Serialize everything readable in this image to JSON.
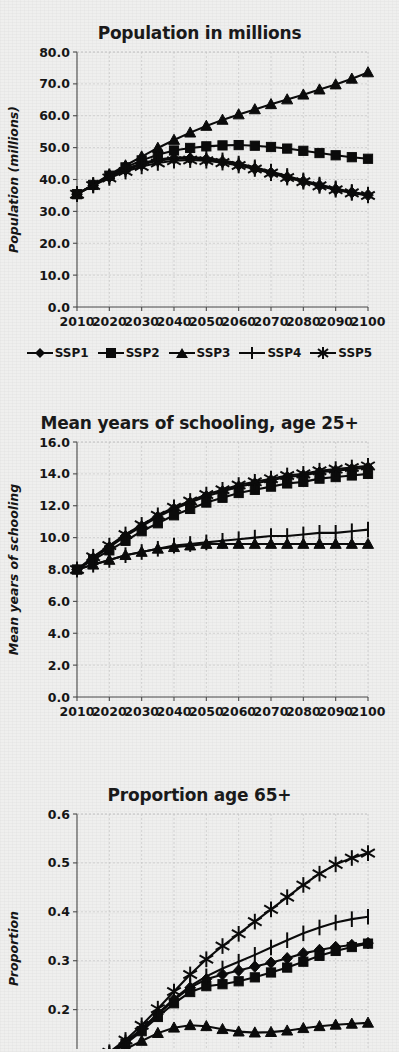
{
  "figure": {
    "background_color": "#efefee",
    "ink_color": "#0b0b0b",
    "grid_color": "#c9c9c9"
  },
  "legend": {
    "position": "below-first-chart",
    "items": [
      {
        "label": "SSP1",
        "marker": "diamond-marker"
      },
      {
        "label": "SSP2",
        "marker": "square-marker"
      },
      {
        "label": "SSP3",
        "marker": "triangle-marker"
      },
      {
        "label": "SSP4",
        "marker": "plus-marker"
      },
      {
        "label": "SSP5",
        "marker": "asterisk-marker"
      }
    ]
  },
  "chart_data": [
    {
      "type": "line",
      "title": "Population in millions",
      "xlabel": "",
      "ylabel": "Population (millions)",
      "xlim": [
        2010,
        2100
      ],
      "ylim": [
        0.0,
        80.0
      ],
      "yticks": [
        "0.0",
        "10.0",
        "20.0",
        "30.0",
        "40.0",
        "50.0",
        "60.0",
        "70.0",
        "80.0"
      ],
      "ytick_values": [
        0,
        10,
        20,
        30,
        40,
        50,
        60,
        70,
        80
      ],
      "xticks": [
        "2010",
        "2020",
        "2030",
        "2040",
        "2050",
        "2060",
        "2070",
        "2080",
        "2090",
        "2100"
      ],
      "xtick_values": [
        2010,
        2020,
        2030,
        2040,
        2050,
        2060,
        2070,
        2080,
        2090,
        2100
      ],
      "grid": true,
      "x": [
        2010,
        2015,
        2020,
        2025,
        2030,
        2035,
        2040,
        2045,
        2050,
        2055,
        2060,
        2065,
        2070,
        2075,
        2080,
        2085,
        2090,
        2095,
        2100
      ],
      "series": [
        {
          "name": "SSP1",
          "marker": "diamond-marker",
          "values": [
            35.4,
            38.2,
            40.8,
            43.0,
            44.7,
            45.9,
            46.5,
            46.6,
            46.3,
            45.6,
            44.6,
            43.4,
            42.1,
            40.7,
            39.4,
            38.1,
            36.9,
            35.9,
            35.1
          ]
        },
        {
          "name": "SSP2",
          "marker": "square-marker",
          "values": [
            35.4,
            38.3,
            41.2,
            43.8,
            46.0,
            47.8,
            49.1,
            49.9,
            50.4,
            50.7,
            50.8,
            50.6,
            50.2,
            49.7,
            49.0,
            48.3,
            47.6,
            47.0,
            46.5
          ]
        },
        {
          "name": "SSP3",
          "marker": "triangle-marker",
          "values": [
            35.4,
            38.4,
            41.5,
            44.4,
            47.2,
            49.9,
            52.4,
            54.7,
            56.8,
            58.7,
            60.4,
            62.0,
            63.6,
            65.1,
            66.6,
            68.2,
            69.8,
            71.6,
            73.6
          ]
        },
        {
          "name": "SSP4",
          "marker": "plus-marker",
          "values": [
            35.4,
            38.3,
            41.0,
            43.3,
            45.1,
            46.3,
            46.9,
            47.0,
            46.7,
            46.0,
            45.0,
            43.8,
            42.5,
            41.1,
            39.7,
            38.4,
            37.2,
            36.1,
            35.3
          ]
        },
        {
          "name": "SSP5",
          "marker": "asterisk-marker",
          "values": [
            35.4,
            38.1,
            40.5,
            42.5,
            44.1,
            45.2,
            45.9,
            46.1,
            45.9,
            45.3,
            44.4,
            43.3,
            42.0,
            40.6,
            39.3,
            38.0,
            36.8,
            35.8,
            35.0
          ]
        }
      ]
    },
    {
      "type": "line",
      "title": "Mean years of schooling, age 25+",
      "xlabel": "",
      "ylabel": "Mean years of schooling",
      "xlim": [
        2010,
        2100
      ],
      "ylim": [
        0.0,
        16.0
      ],
      "yticks": [
        "0.0",
        "2.0",
        "4.0",
        "6.0",
        "8.0",
        "10.0",
        "12.0",
        "14.0",
        "16.0"
      ],
      "ytick_values": [
        0,
        2,
        4,
        6,
        8,
        10,
        12,
        14,
        16
      ],
      "xticks": [
        "2010",
        "2020",
        "2030",
        "2040",
        "2050",
        "2060",
        "2070",
        "2080",
        "2090",
        "2100"
      ],
      "xtick_values": [
        2010,
        2020,
        2030,
        2040,
        2050,
        2060,
        2070,
        2080,
        2090,
        2100
      ],
      "grid": true,
      "x": [
        2010,
        2015,
        2020,
        2025,
        2030,
        2035,
        2040,
        2045,
        2050,
        2055,
        2060,
        2065,
        2070,
        2075,
        2080,
        2085,
        2090,
        2095,
        2100
      ],
      "series": [
        {
          "name": "SSP1",
          "marker": "diamond-marker",
          "values": [
            8.0,
            8.7,
            9.4,
            10.1,
            10.7,
            11.3,
            11.8,
            12.2,
            12.6,
            12.9,
            13.2,
            13.4,
            13.6,
            13.8,
            13.9,
            14.1,
            14.2,
            14.3,
            14.4
          ]
        },
        {
          "name": "SSP2",
          "marker": "square-marker",
          "values": [
            8.0,
            8.6,
            9.2,
            9.8,
            10.4,
            10.9,
            11.4,
            11.8,
            12.2,
            12.5,
            12.8,
            13.0,
            13.2,
            13.4,
            13.5,
            13.7,
            13.8,
            13.9,
            14.0
          ]
        },
        {
          "name": "SSP3",
          "marker": "triangle-marker",
          "values": [
            8.0,
            8.3,
            8.6,
            8.9,
            9.1,
            9.3,
            9.4,
            9.5,
            9.6,
            9.6,
            9.6,
            9.6,
            9.6,
            9.6,
            9.6,
            9.6,
            9.6,
            9.6,
            9.6
          ]
        },
        {
          "name": "SSP4",
          "marker": "plus-marker",
          "values": [
            8.0,
            8.3,
            8.6,
            8.9,
            9.1,
            9.3,
            9.5,
            9.6,
            9.7,
            9.8,
            9.9,
            10.0,
            10.1,
            10.1,
            10.2,
            10.3,
            10.3,
            10.4,
            10.5
          ]
        },
        {
          "name": "SSP5",
          "marker": "asterisk-marker",
          "values": [
            8.0,
            8.8,
            9.5,
            10.2,
            10.8,
            11.4,
            11.9,
            12.3,
            12.7,
            13.0,
            13.3,
            13.5,
            13.7,
            13.9,
            14.0,
            14.2,
            14.3,
            14.4,
            14.5
          ]
        }
      ]
    },
    {
      "type": "line",
      "title": "Proportion age 65+",
      "xlabel": "",
      "ylabel": "Proportion",
      "xlim": [
        2010,
        2100
      ],
      "ylim": [
        0.05,
        0.6
      ],
      "yticks": [
        "0.1",
        "0.2",
        "0.3",
        "0.4",
        "0.5",
        "0.6"
      ],
      "ytick_values": [
        0.1,
        0.2,
        0.3,
        0.4,
        0.5,
        0.6
      ],
      "xticks": [],
      "xtick_values": [],
      "grid": true,
      "cropped": true,
      "x": [
        2010,
        2015,
        2020,
        2025,
        2030,
        2035,
        2040,
        2045,
        2050,
        2055,
        2060,
        2065,
        2070,
        2075,
        2080,
        2085,
        2090,
        2095,
        2100
      ],
      "series": [
        {
          "name": "SSP1",
          "marker": "diamond-marker",
          "values": [
            0.077,
            0.092,
            0.11,
            0.133,
            0.16,
            0.19,
            0.22,
            0.245,
            0.262,
            0.272,
            0.28,
            0.288,
            0.296,
            0.305,
            0.315,
            0.322,
            0.328,
            0.332,
            0.336
          ]
        },
        {
          "name": "SSP2",
          "marker": "square-marker",
          "values": [
            0.077,
            0.091,
            0.108,
            0.13,
            0.156,
            0.185,
            0.213,
            0.236,
            0.248,
            0.252,
            0.258,
            0.266,
            0.276,
            0.286,
            0.298,
            0.31,
            0.32,
            0.328,
            0.335
          ]
        },
        {
          "name": "SSP3",
          "marker": "triangle-marker",
          "values": [
            0.077,
            0.089,
            0.103,
            0.119,
            0.136,
            0.152,
            0.163,
            0.168,
            0.166,
            0.16,
            0.155,
            0.153,
            0.154,
            0.157,
            0.162,
            0.166,
            0.169,
            0.171,
            0.173
          ]
        },
        {
          "name": "SSP4",
          "marker": "plus-marker",
          "values": [
            0.077,
            0.092,
            0.11,
            0.133,
            0.161,
            0.192,
            0.222,
            0.248,
            0.268,
            0.284,
            0.298,
            0.312,
            0.327,
            0.342,
            0.356,
            0.368,
            0.378,
            0.385,
            0.39
          ]
        },
        {
          "name": "SSP5",
          "marker": "asterisk-marker",
          "values": [
            0.077,
            0.093,
            0.113,
            0.138,
            0.168,
            0.202,
            0.237,
            0.272,
            0.303,
            0.33,
            0.355,
            0.38,
            0.405,
            0.43,
            0.455,
            0.478,
            0.497,
            0.51,
            0.52
          ]
        }
      ]
    }
  ]
}
